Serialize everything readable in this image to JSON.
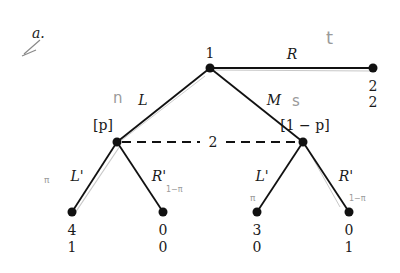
{
  "figure_label": "a.",
  "player_root": "1",
  "info_set_player": "2",
  "moves": {
    "R": "R",
    "L": "L",
    "M": "M",
    "L_prime_left": "L'",
    "R_prime_left": "R'",
    "L_prime_right": "L'",
    "R_prime_right": "R'"
  },
  "beliefs": {
    "left": "[p]",
    "right": "[1 − p]"
  },
  "payoffs": {
    "R": [
      "2",
      "2"
    ],
    "L_L": [
      "4",
      "1"
    ],
    "L_R": [
      "0",
      "0"
    ],
    "M_L": [
      "3",
      "0"
    ],
    "M_R": [
      "0",
      "1"
    ]
  },
  "handwritten": {
    "t": "t",
    "n": "n",
    "s": "s",
    "pi_left1": "π",
    "pi_left2": "1−π",
    "pi_right1": "π",
    "pi_right2": "1−π"
  },
  "colors": {
    "ink": "#111111",
    "pencil": "#9a9a9a"
  }
}
